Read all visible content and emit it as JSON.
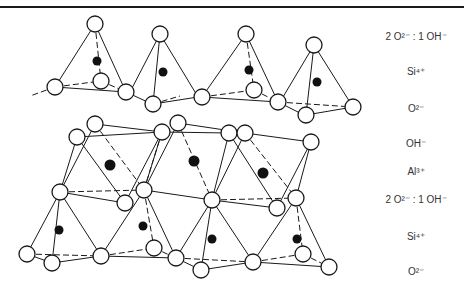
{
  "figure": {
    "legend_layers": [
      {
        "label": "2 O²⁻ : 1 OH⁻",
        "y": 36
      },
      {
        "label": "Si⁴⁺",
        "y": 71
      },
      {
        "label": "O²⁻",
        "y": 108
      },
      {
        "label": "OH⁻",
        "y": 143
      },
      {
        "label": "Al³⁺",
        "y": 171
      },
      {
        "label": "2 O²⁻ : 1 OH⁻",
        "y": 199
      },
      {
        "label": "Si⁴⁺",
        "y": 236
      },
      {
        "label": "O²⁻",
        "y": 271
      }
    ],
    "colors": {
      "line": "#1a1a1a",
      "anion_fill": "#ffffff",
      "cation_fill": "#111111"
    }
  }
}
